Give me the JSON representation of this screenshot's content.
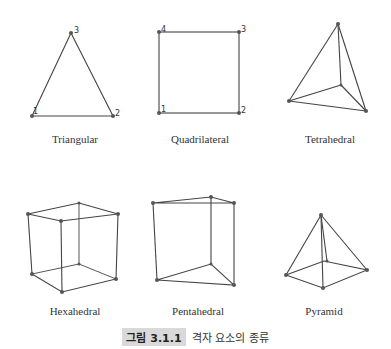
{
  "figure": {
    "caption": {
      "number": "그림 3.1.1",
      "text": "격자 요소의 종류"
    },
    "elements": [
      {
        "name": "Triangular",
        "nodes": [
          "1",
          "2",
          "3"
        ]
      },
      {
        "name": "Quadrilateral",
        "nodes": [
          "1",
          "2",
          "3",
          "4"
        ]
      },
      {
        "name": "Tetrahedral",
        "nodes": [
          "1",
          "2",
          "3",
          "4"
        ]
      },
      {
        "name": "Hexahedral",
        "nodes": [
          "1",
          "2",
          "3",
          "4",
          "5",
          "6",
          "7",
          "8"
        ]
      },
      {
        "name": "Pentahedral",
        "nodes": [
          "1",
          "2",
          "3",
          "4",
          "5",
          "6"
        ]
      },
      {
        "name": "Pyramid",
        "nodes": [
          "1",
          "2",
          "3",
          "4",
          "5"
        ]
      }
    ],
    "colors": {
      "line": "#444444",
      "node": "#555555",
      "badge_bg": "#d9d9d9"
    }
  }
}
